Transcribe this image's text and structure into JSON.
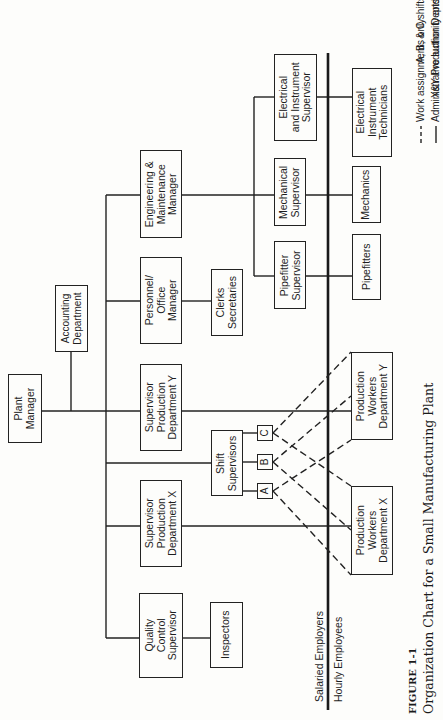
{
  "orientation": "rotated 90° counter-clockwise (text reads bottom-to-top)",
  "colors": {
    "line": "#222222",
    "background": "#fdfdfb"
  },
  "nodes": {
    "plant_manager": "Plant\nManager",
    "accounting": "Accounting\nDepartment",
    "engineering": "Engineering &\nMaintenance\nManager",
    "personnel": "Personnel/\nOffice\nManager",
    "supervisor_y": "Supervisor\nProduction\nDepartment Y",
    "supervisor_x": "Supervisor\nProduction\nDepartment X",
    "quality_control": "Quality\nControl\nSupervisor",
    "clerks": "Clerks\nSecretaries",
    "shift_supervisors": "Shift\nSupervisors",
    "shift_a": "A",
    "shift_b": "B",
    "shift_c": "C",
    "inspectors": "Inspectors",
    "ei_supervisor": "Electrical\nand Instrument\nSupervisor",
    "mechanical_supervisor": "Mechanical\nSupervisor",
    "pipefitter_supervisor": "Pipefitter\nSupervisor",
    "ei_technicians": "Electrical\nInstrument\nTechnicians",
    "mechanics": "Mechanics",
    "pipefitters": "Pipefitters",
    "production_y": "Production\nWorkers\nDepartment Y",
    "production_x": "Production\nWorkers\nDepartment X"
  },
  "divider": {
    "salaried_label": "Salaried  Employers",
    "hourly_label": "Hourly Employees"
  },
  "legend": {
    "dashed": "Work assignments only",
    "solid": "Administrative authority and responsibility",
    "shifts": "A, B, & C shifts",
    "depts": "X&Y Production Depts."
  },
  "caption": {
    "figure": "FIGURE 1-1",
    "title": "Organization Chart for a Small Manufacturing Plant"
  }
}
